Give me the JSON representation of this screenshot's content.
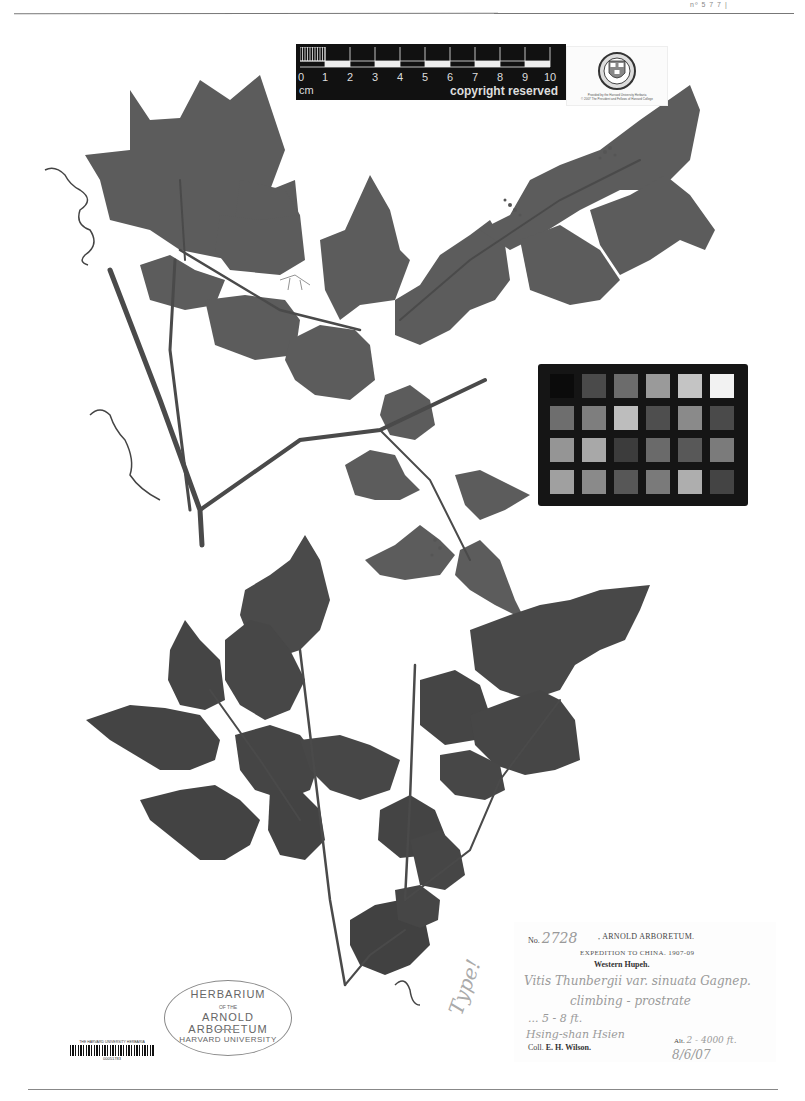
{
  "page": {
    "header_text": "nº 5 7 7 |",
    "background": "#ffffff"
  },
  "scale_bar": {
    "numbers": [
      "0",
      "1",
      "2",
      "3",
      "4",
      "5",
      "6",
      "7",
      "8",
      "9",
      "10"
    ],
    "unit": "cm",
    "copyright": "copyright reserved"
  },
  "seal_card": {
    "seal_text": "VERITAS",
    "caption_line1": "Provided by the Harvard University Herbaria",
    "caption_line2": "© 2007 The President and Fellows of Harvard College"
  },
  "color_chart": {
    "rows": [
      [
        "#0b0b0b",
        "#4a4a4a",
        "#6c6c6c",
        "#9a9a9a",
        "#c4c4c4",
        "#f2f2f2"
      ],
      [
        "#6e6e6e",
        "#7e7e7e",
        "#bdbdbd",
        "#4e4e4e",
        "#8a8a8a",
        "#4a4a4a"
      ],
      [
        "#959595",
        "#a8a8a8",
        "#3c3c3c",
        "#6a6a6a",
        "#585858",
        "#7b7b7b"
      ],
      [
        "#a0a0a0",
        "#8a8a8a",
        "#575757",
        "#7a7a7a",
        "#aeaeae",
        "#444444"
      ]
    ]
  },
  "label": {
    "no_prefix": "No.",
    "number": "2728",
    "institution": ", ARNOLD ARBORETUM.",
    "expedition": "EXPEDITION TO CHINA. 1907-09",
    "region": "Western Hupeh.",
    "handwritten": [
      "Vitis Thunbergii var. sinuata Gagnep.",
      "climbing - prostrate",
      "...  5 - 8 ft.",
      "Hsing-shan Hsien"
    ],
    "alt_label": "Alt.",
    "alt_value": "2 - 4000 ft.",
    "collector_prefix": "Coll.",
    "collector": "E. H. Wilson.",
    "date_handwritten": "8/6/07"
  },
  "stamp": {
    "line1": "HERBARIUM",
    "line2": "OF THE",
    "line3": "ARNOLD ARBORETUM",
    "line4": "HARVARD UNIVERSITY"
  },
  "barcode": {
    "title": "THE HARVARD UNIVERSITY HERBARIA",
    "number": "00051783"
  },
  "annotation": {
    "text": "Type!"
  },
  "specimen": {
    "taxon": "Vitis",
    "leaf_color": "#5c5c5c",
    "leaf_color_dark": "#3f3f3f",
    "stem_color": "#4a4a4a"
  }
}
